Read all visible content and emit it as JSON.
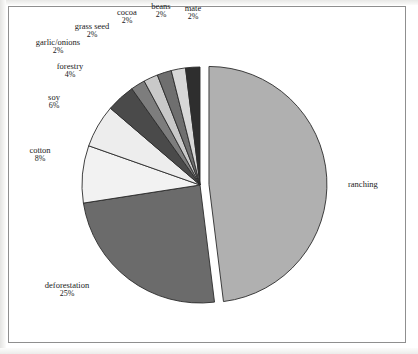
{
  "figure": {
    "background_color": "#ffffff",
    "frame_color": "#8f8f8f",
    "outline_color": "#2b2b2b"
  },
  "chart_data": {
    "type": "pie",
    "title": "",
    "subtitle": "",
    "xlabel": "",
    "ylabel": "",
    "legend_position": "none",
    "grid": false,
    "labels_outside": true,
    "exploded_slice": "ranching",
    "start_angle_deg": 0,
    "direction": "clockwise",
    "categories": [
      "ranching",
      "deforestation",
      "cotton",
      "soy",
      "forestry",
      "garlic/onions",
      "grass seed",
      "cocoa",
      "beans",
      "mate"
    ],
    "values": [
      49,
      25,
      8,
      6,
      4,
      2,
      2,
      2,
      2,
      2
    ],
    "value_labels": [
      "",
      "25%",
      "8%",
      "6%",
      "4%",
      "2%",
      "2%",
      "2%",
      "2%",
      "2%"
    ],
    "colors": [
      "#b0b0b0",
      "#6b6b6b",
      "#f2f2f2",
      "#ededed",
      "#4a4a4a",
      "#7d7d7d",
      "#c9c9c9",
      "#6f6f6f",
      "#d8d8d8",
      "#2e2e2e"
    ],
    "slices": [
      {
        "name": "ranching",
        "percent": 49,
        "label": "ranching",
        "percent_label": "",
        "color": "#b0b0b0",
        "exploded": true
      },
      {
        "name": "deforestation",
        "percent": 25,
        "label": "deforestation",
        "percent_label": "25%",
        "color": "#6b6b6b",
        "exploded": false
      },
      {
        "name": "cotton",
        "percent": 8,
        "label": "cotton",
        "percent_label": "8%",
        "color": "#f2f2f2",
        "exploded": false
      },
      {
        "name": "soy",
        "percent": 6,
        "label": "soy",
        "percent_label": "6%",
        "color": "#ededed",
        "exploded": false
      },
      {
        "name": "forestry",
        "percent": 4,
        "label": "forestry",
        "percent_label": "4%",
        "color": "#4a4a4a",
        "exploded": false
      },
      {
        "name": "garlic/onions",
        "percent": 2,
        "label": "garlic/onions",
        "percent_label": "2%",
        "color": "#7d7d7d",
        "exploded": false
      },
      {
        "name": "grass seed",
        "percent": 2,
        "label": "grass seed",
        "percent_label": "2%",
        "color": "#c9c9c9",
        "exploded": false
      },
      {
        "name": "cocoa",
        "percent": 2,
        "label": "cocoa",
        "percent_label": "2%",
        "color": "#6f6f6f",
        "exploded": false
      },
      {
        "name": "beans",
        "percent": 2,
        "label": "beans",
        "percent_label": "2%",
        "color": "#d8d8d8",
        "exploded": false
      },
      {
        "name": "mate",
        "percent": 2,
        "label": "mate",
        "percent_label": "2%",
        "color": "#2e2e2e",
        "exploded": false
      }
    ]
  }
}
